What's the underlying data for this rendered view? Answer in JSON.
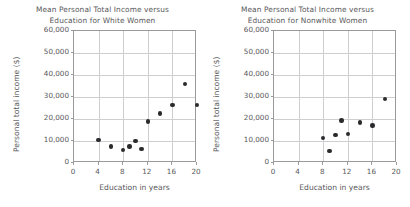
{
  "chart_data": [
    {
      "type": "scatter",
      "title": "Mean Personal Total Income versus Education for White Women",
      "title_line1": "Mean Personal Total Income versus",
      "title_line2": "Education for White Women",
      "xlabel": "Education in years",
      "ylabel": "Personal total income ($)",
      "xlim": [
        0,
        20
      ],
      "ylim": [
        0,
        60000
      ],
      "xticks": [
        0,
        4,
        8,
        12,
        16,
        20
      ],
      "xtick_labels": [
        "0",
        "4",
        "8",
        "12",
        "16",
        "20"
      ],
      "yticks": [
        0,
        10000,
        20000,
        30000,
        40000,
        50000,
        60000
      ],
      "ytick_labels": [
        "0",
        "10,000",
        "20,000",
        "30,000",
        "40,000",
        "50,000",
        "60,000"
      ],
      "grid": true,
      "legend": "none",
      "marker_color": "#2b2b2d",
      "x": [
        4,
        6,
        8,
        9,
        10,
        11,
        12,
        14,
        16,
        18,
        20
      ],
      "y": [
        10500,
        7500,
        6000,
        7500,
        10000,
        6300,
        18800,
        22500,
        26500,
        36000,
        26500
      ],
      "points": [
        {
          "x": 4,
          "y": 10500
        },
        {
          "x": 6,
          "y": 7500
        },
        {
          "x": 8,
          "y": 6000
        },
        {
          "x": 9,
          "y": 7500
        },
        {
          "x": 10,
          "y": 10000
        },
        {
          "x": 11,
          "y": 6300
        },
        {
          "x": 12,
          "y": 18800
        },
        {
          "x": 14,
          "y": 22500
        },
        {
          "x": 16,
          "y": 26500
        },
        {
          "x": 18,
          "y": 36000
        },
        {
          "x": 20,
          "y": 26500
        }
      ]
    },
    {
      "type": "scatter",
      "title": "Mean Personal Total Income versus Education for Nonwhite Women",
      "title_line1": "Mean Personal Total Income versus",
      "title_line2": "Education for Nonwhite Women",
      "xlabel": "Education in years",
      "ylabel": "Personal total income ($)",
      "xlim": [
        0,
        20
      ],
      "ylim": [
        0,
        60000
      ],
      "xticks": [
        0,
        4,
        8,
        12,
        16,
        20
      ],
      "xtick_labels": [
        "0",
        "4",
        "8",
        "12",
        "16",
        "20"
      ],
      "yticks": [
        0,
        10000,
        20000,
        30000,
        40000,
        50000,
        60000
      ],
      "ytick_labels": [
        "0",
        "10,000",
        "20,000",
        "30,000",
        "40,000",
        "50,000",
        "60,000"
      ],
      "grid": true,
      "legend": "none",
      "marker_color": "#2b2b2d",
      "x": [
        8,
        9,
        10,
        11,
        12,
        14,
        16,
        18
      ],
      "y": [
        11500,
        5500,
        12700,
        19300,
        13300,
        18500,
        17000,
        29000
      ],
      "points": [
        {
          "x": 8,
          "y": 11500
        },
        {
          "x": 9,
          "y": 5500
        },
        {
          "x": 10,
          "y": 12700
        },
        {
          "x": 11,
          "y": 19300
        },
        {
          "x": 12,
          "y": 13300
        },
        {
          "x": 14,
          "y": 18500
        },
        {
          "x": 16,
          "y": 17000
        },
        {
          "x": 18,
          "y": 29000
        }
      ]
    }
  ]
}
